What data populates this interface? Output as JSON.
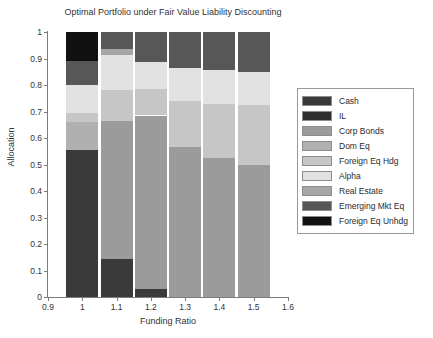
{
  "chart_data": {
    "type": "bar",
    "stacked": true,
    "title": "Optimal Portfolio under Fair Value Liability Discounting",
    "xlabel": "Funding Ratio",
    "ylabel": "Allocation",
    "xlim": [
      0.9,
      1.6
    ],
    "ylim": [
      0,
      1
    ],
    "grid": false,
    "legend_position": "right-outside",
    "categories": [
      "1",
      "1.1",
      "1.2",
      "1.3",
      "1.4",
      "1.5"
    ],
    "xticks": [
      "0.9",
      "1",
      "1.1",
      "1.2",
      "1.3",
      "1.4",
      "1.5",
      "1.6"
    ],
    "yticks": [
      "0",
      "0.1",
      "0.2",
      "0.3",
      "0.4",
      "0.5",
      "0.6",
      "0.7",
      "0.8",
      "0.9",
      "1"
    ],
    "series": [
      {
        "name": "Cash",
        "color": "#3a3a3a",
        "values": [
          0.555,
          0.145,
          0.03,
          0.0,
          0.0,
          0.0
        ]
      },
      {
        "name": "IL",
        "color": "#2f2f2f",
        "values": [
          0.0,
          0.0,
          0.0,
          0.0,
          0.0,
          0.0
        ]
      },
      {
        "name": "Corp Bonds",
        "color": "#9b9b9b",
        "values": [
          0.0,
          0.52,
          0.655,
          0.565,
          0.525,
          0.5
        ]
      },
      {
        "name": "Dom Eq",
        "color": "#b0b0b0",
        "values": [
          0.105,
          0.0,
          0.0,
          0.0,
          0.0,
          0.0
        ]
      },
      {
        "name": "Foreign Eq Hdg",
        "color": "#c6c6c6",
        "values": [
          0.035,
          0.115,
          0.1,
          0.175,
          0.205,
          0.225
        ]
      },
      {
        "name": "Alpha",
        "color": "#e2e2e2",
        "values": [
          0.105,
          0.135,
          0.1,
          0.125,
          0.125,
          0.125
        ]
      },
      {
        "name": "Real Estate",
        "color": "#a6a6a6",
        "values": [
          0.0,
          0.02,
          0.0,
          0.0,
          0.0,
          0.0
        ]
      },
      {
        "name": "Emerging Mkt Eq",
        "color": "#575757",
        "values": [
          0.09,
          0.065,
          0.115,
          0.135,
          0.145,
          0.15
        ]
      },
      {
        "name": "Foreign Eq Unhdg",
        "color": "#111111",
        "values": [
          0.11,
          0.0,
          0.0,
          0.0,
          0.0,
          0.0
        ]
      }
    ]
  },
  "legend": {
    "items": [
      {
        "label": "Cash",
        "color": "#3a3a3a"
      },
      {
        "label": "IL",
        "color": "#2f2f2f"
      },
      {
        "label": "Corp Bonds",
        "color": "#9b9b9b"
      },
      {
        "label": "Dom Eq",
        "color": "#b0b0b0"
      },
      {
        "label": "Foreign Eq Hdg",
        "color": "#c6c6c6"
      },
      {
        "label": "Alpha",
        "color": "#e2e2e2"
      },
      {
        "label": "Real Estate",
        "color": "#a6a6a6"
      },
      {
        "label": "Emerging Mkt Eq",
        "color": "#575757"
      },
      {
        "label": "Foreign Eq Unhdg",
        "color": "#111111"
      }
    ]
  },
  "axes": {
    "axis_color": "#7c7c7c",
    "text_color": "#333333"
  }
}
